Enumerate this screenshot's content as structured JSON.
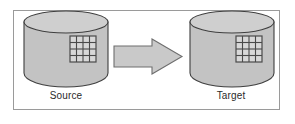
{
  "figure": {
    "background_color": "#ffffff",
    "border_color": "#9a9a9a"
  },
  "diagram": {
    "type": "flow",
    "source": {
      "label": "Source",
      "shape": "cylinder",
      "icon": "table-grid-icon",
      "grid_columns": 4,
      "grid_rows": 4,
      "body_color": "#c3c3c3",
      "top_color": "#cfcfcf",
      "outline_color": "#4a4a4a"
    },
    "connector": {
      "label": "",
      "shape": "block-arrow-right",
      "direction": "right",
      "fill_color": "#c9c9c9",
      "outline_color": "#6e6e6e"
    },
    "target": {
      "label": "Target",
      "shape": "cylinder",
      "icon": "table-grid-icon",
      "grid_columns": 4,
      "grid_rows": 4,
      "body_color": "#c3c3c3",
      "top_color": "#cfcfcf",
      "outline_color": "#4a4a4a"
    }
  }
}
